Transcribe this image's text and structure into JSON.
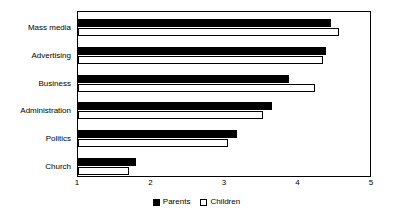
{
  "chart_data": {
    "type": "bar",
    "orientation": "horizontal",
    "title": "",
    "xlabel": "",
    "ylabel": "",
    "xlim": [
      1,
      5
    ],
    "xticks": [
      "1",
      "2",
      "3",
      "4",
      "5"
    ],
    "grid": false,
    "legend_position": "bottom-center",
    "categories": [
      "Mass media",
      "Advertising",
      "Business",
      "Administration",
      "Politics",
      "Church"
    ],
    "series": [
      {
        "name": "Parents",
        "color": "#000000",
        "values": [
          4.44,
          4.37,
          3.87,
          3.64,
          3.16,
          1.79
        ]
      },
      {
        "name": "Children",
        "color": "#ffffff",
        "values": [
          4.55,
          4.33,
          4.22,
          3.52,
          3.04,
          1.69
        ]
      }
    ]
  },
  "legend": {
    "items": [
      {
        "label": "Parents",
        "swatch": "filled-square-icon"
      },
      {
        "label": "Children",
        "swatch": "empty-square-icon"
      }
    ]
  },
  "colors": {
    "parents": "#000000",
    "children": "#ffffff",
    "axis": "#000000",
    "background": "#ffffff"
  }
}
